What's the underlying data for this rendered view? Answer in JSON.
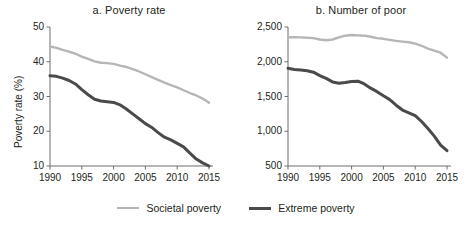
{
  "figure": {
    "legend": [
      {
        "name": "legend-societal",
        "label": "Societal poverty",
        "color": "#b6b6b6",
        "width": 2.6
      },
      {
        "name": "legend-extreme",
        "label": "Extreme poverty",
        "color": "#4a4a4a",
        "width": 3.2
      }
    ]
  },
  "chart_data": [
    {
      "type": "line",
      "panel": "a",
      "title": "a. Poverty rate",
      "xlabel": "",
      "ylabel": "Poverty rate (%)",
      "xlim": [
        1990,
        2015
      ],
      "ylim": [
        10,
        50
      ],
      "xticks": [
        1990,
        1995,
        2000,
        2005,
        2010,
        2015
      ],
      "xticklabels": [
        "1990",
        "1995",
        "2000",
        "2005",
        "2010",
        "2015"
      ],
      "yticks": [
        10,
        20,
        30,
        40,
        50
      ],
      "yticklabels": [
        "10",
        "20",
        "30",
        "40",
        "50"
      ],
      "grid": false,
      "legend_position": "bottom",
      "x": [
        1990,
        1991,
        1992,
        1993,
        1994,
        1995,
        1996,
        1997,
        1998,
        1999,
        2000,
        2001,
        2002,
        2003,
        2004,
        2005,
        2006,
        2007,
        2008,
        2009,
        2010,
        2011,
        2012,
        2013,
        2014,
        2015
      ],
      "series": [
        {
          "name": "Societal poverty",
          "color": "#b6b6b6",
          "values": [
            44.4,
            44.0,
            43.4,
            42.9,
            42.3,
            41.5,
            40.8,
            40.1,
            39.7,
            39.6,
            39.4,
            38.9,
            38.5,
            37.9,
            37.2,
            36.4,
            35.6,
            34.8,
            34.0,
            33.3,
            32.6,
            31.8,
            31.0,
            30.3,
            29.4,
            28.2
          ]
        },
        {
          "name": "Extreme poverty",
          "color": "#4a4a4a",
          "values": [
            36.0,
            35.8,
            35.3,
            34.6,
            33.6,
            32.0,
            30.5,
            29.2,
            28.7,
            28.5,
            28.3,
            27.6,
            26.4,
            25.0,
            23.6,
            22.2,
            21.1,
            19.6,
            18.3,
            17.5,
            16.5,
            15.5,
            13.7,
            12.0,
            10.9,
            10.0
          ]
        }
      ]
    },
    {
      "type": "line",
      "panel": "b",
      "title": "b. Number of poor",
      "xlabel": "",
      "ylabel": "Millions",
      "xlim": [
        1990,
        2015
      ],
      "ylim": [
        500,
        2500
      ],
      "xticks": [
        1990,
        1995,
        2000,
        2005,
        2010,
        2015
      ],
      "xticklabels": [
        "1990",
        "1995",
        "2000",
        "2005",
        "2010",
        "2015"
      ],
      "yticks": [
        500,
        1000,
        1500,
        2000,
        2500
      ],
      "yticklabels": [
        "500",
        "1,000",
        "1,500",
        "2,000",
        "2,500"
      ],
      "grid": false,
      "legend_position": "bottom",
      "x": [
        1990,
        1991,
        1992,
        1993,
        1994,
        1995,
        1996,
        1997,
        1998,
        1999,
        2000,
        2001,
        2002,
        2003,
        2004,
        2005,
        2006,
        2007,
        2008,
        2009,
        2010,
        2011,
        2012,
        2013,
        2014,
        2015
      ],
      "series": [
        {
          "name": "Societal poverty",
          "color": "#b6b6b6",
          "values": [
            2350,
            2355,
            2350,
            2345,
            2340,
            2320,
            2310,
            2320,
            2350,
            2375,
            2385,
            2380,
            2375,
            2360,
            2340,
            2330,
            2315,
            2300,
            2290,
            2280,
            2260,
            2230,
            2190,
            2160,
            2130,
            2060
          ]
        },
        {
          "name": "Extreme poverty",
          "color": "#4a4a4a",
          "values": [
            1905,
            1890,
            1880,
            1870,
            1850,
            1800,
            1760,
            1710,
            1690,
            1700,
            1715,
            1720,
            1680,
            1620,
            1570,
            1510,
            1455,
            1375,
            1305,
            1265,
            1225,
            1140,
            1040,
            930,
            800,
            720
          ]
        }
      ]
    }
  ]
}
